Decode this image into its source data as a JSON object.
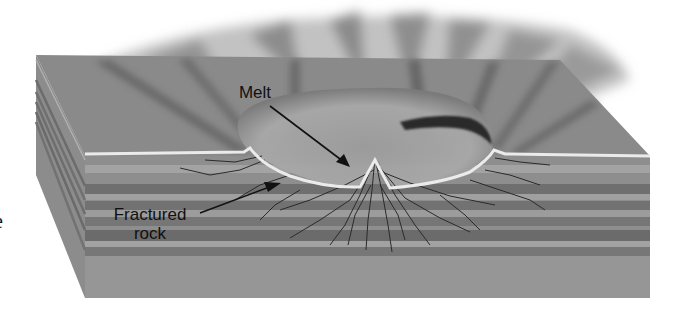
{
  "figure": {
    "labels": {
      "melt": "Melt",
      "fractured_line1": "Fractured",
      "fractured_line2": "rock",
      "cut_off_text": "e"
    },
    "colors": {
      "background": "#ffffff",
      "top_surface": "#8a8a8a",
      "ejecta_plume": "#6e6e6e",
      "layer_light": "#9a9a9a",
      "layer_dark": "#6f6f6f",
      "side_face": "#8c8c8c",
      "crater_rim": "#e8e8e8",
      "melt_dark": "#2a2a2a",
      "fracture_lines": "#2b2b2b",
      "label_text": "#111111"
    }
  }
}
